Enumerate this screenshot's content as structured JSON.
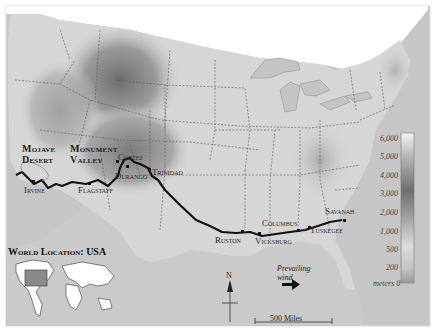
{
  "map": {
    "type": "relief map",
    "subject": "Route across the southern United States",
    "regions": [
      {
        "label": "Mojave",
        "label2": "Desert"
      },
      {
        "label": "Monument",
        "label2": "Valley"
      }
    ],
    "cities": [
      {
        "name": "Irvine"
      },
      {
        "name": "Flagstaff"
      },
      {
        "name": "Cortez"
      },
      {
        "name": "Durango"
      },
      {
        "name": "Trinidad"
      },
      {
        "name": "Ruston"
      },
      {
        "name": "Vicksburg"
      },
      {
        "name": "Columbus"
      },
      {
        "name": "Tuskegee"
      },
      {
        "name": "Savanah"
      }
    ],
    "elevation_legend": {
      "unit_label": "meters",
      "ticks": [
        "6,000",
        "5,000",
        "4,000",
        "3,000",
        "2,000",
        "1,000",
        "500",
        "200",
        "0"
      ]
    },
    "inset": {
      "title": "World Location: USA"
    },
    "wind": {
      "label_line1": "Prevailing",
      "label_line2": "wind",
      "direction": "east"
    },
    "north_arrow": {
      "label": "N"
    },
    "scale_bar": {
      "label": "500 Miles"
    },
    "colors": {
      "land_low": "#d6d6d6",
      "land_high": "#7a7a7a",
      "water": "#ffffff",
      "outside_land": "#bdbdbd",
      "route": "#111111",
      "frame": "#e3e3e3"
    }
  }
}
